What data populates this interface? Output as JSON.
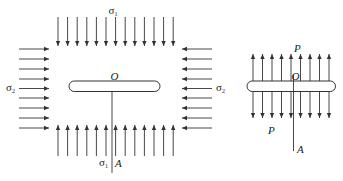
{
  "diagram": {
    "left_panel": {
      "labels": {
        "top_stress": "σ",
        "top_stress_sub": "1",
        "bottom_stress": "σ",
        "bottom_stress_sub": "1",
        "left_stress": "σ",
        "left_stress_sub": "2",
        "right_stress": "σ",
        "right_stress_sub": "2",
        "center": "O",
        "crack_tip": "A"
      },
      "description": "Crack slot under biaxial compression: σ1 vertical arrows (top pointing down, bottom pointing up), σ2 horizontal arrows (left pointing right, right pointing left)",
      "vertical_arrow_count": 13,
      "horizontal_arrow_count": 9
    },
    "right_panel": {
      "labels": {
        "top_load": "P",
        "bottom_load": "P",
        "center": "O",
        "crack_tip": "A"
      },
      "description": "Crack slot under internal pressure P: arrows pointing up above and down below",
      "arrow_count": 9
    },
    "colors": {
      "stroke": "#333333",
      "background": "#ffffff"
    }
  }
}
